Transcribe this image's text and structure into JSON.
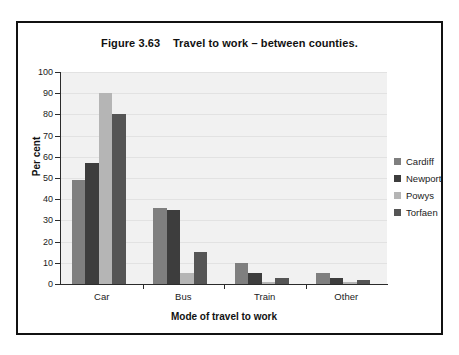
{
  "figure": {
    "title": "Figure 3.63    Travel to work – between counties."
  },
  "chart_data": {
    "type": "bar",
    "title": "Figure 3.63    Travel to work – between counties.",
    "xlabel": "Mode of travel to work",
    "ylabel": "Per cent",
    "ylim": [
      0,
      100
    ],
    "ytick_step": 10,
    "yticks": [
      0,
      10,
      20,
      30,
      40,
      50,
      60,
      70,
      80,
      90,
      100
    ],
    "ytick_labels": [
      "0",
      "10",
      "20",
      "30",
      "40",
      "50",
      "60",
      "70",
      "80",
      "90",
      "100"
    ],
    "grid": true,
    "grid_axis": "y",
    "legend_position": "right",
    "categories": [
      "Car",
      "Bus",
      "Train",
      "Other"
    ],
    "series": [
      {
        "name": "Cardiff",
        "color": "#7f7f7f",
        "values": [
          49,
          36,
          10,
          5
        ]
      },
      {
        "name": "Newport",
        "color": "#3d3d3d",
        "values": [
          57,
          35,
          5,
          3
        ]
      },
      {
        "name": "Powys",
        "color": "#b5b5b5",
        "values": [
          90,
          5,
          1,
          1
        ]
      },
      {
        "name": "Torfaen",
        "color": "#555555",
        "values": [
          80,
          15,
          3,
          2
        ]
      }
    ]
  },
  "colors": {
    "frame_border": "#111111",
    "plot_background": "#f1f1f1",
    "gridline": "#e2e2e2",
    "axis_line": "#2b2b2b",
    "text": "#1b1b1b"
  }
}
